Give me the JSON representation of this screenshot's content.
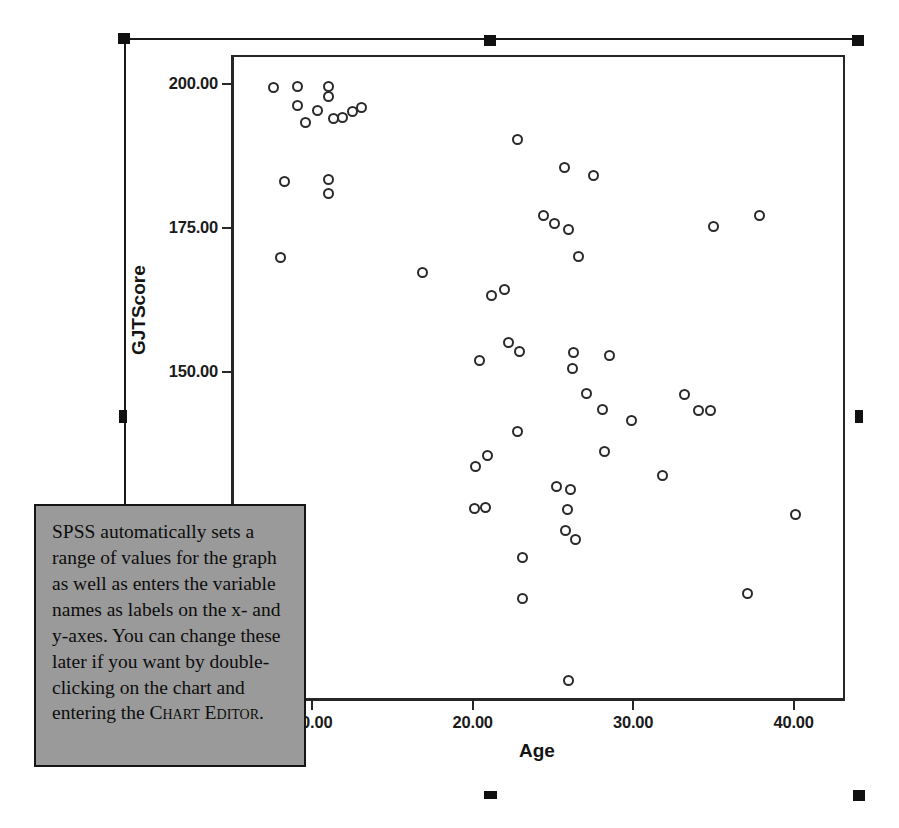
{
  "chart_data": {
    "type": "scatter",
    "title": "",
    "xlabel": "Age",
    "ylabel": "GJTScore",
    "xlim": [
      5.0,
      43.2
    ],
    "ylim": [
      93.0,
      205.0
    ],
    "xticks": [
      "10.00",
      "20.00",
      "30.00",
      "40.00"
    ],
    "xtick_values": [
      10,
      20,
      30,
      40
    ],
    "yticks": [
      "125.00",
      "150.00",
      "175.00",
      "200.00"
    ],
    "ytick_values": [
      125,
      150,
      175,
      200
    ],
    "grid": false,
    "legend": "none",
    "marker": "open-circle",
    "points": [
      {
        "x": 7.6,
        "y": 199.3
      },
      {
        "x": 9.1,
        "y": 199.6
      },
      {
        "x": 9.1,
        "y": 196.3
      },
      {
        "x": 9.6,
        "y": 193.2
      },
      {
        "x": 10.3,
        "y": 195.3
      },
      {
        "x": 8.3,
        "y": 183.0
      },
      {
        "x": 8.0,
        "y": 169.8
      },
      {
        "x": 11.0,
        "y": 199.6
      },
      {
        "x": 11.0,
        "y": 197.8
      },
      {
        "x": 11.3,
        "y": 194.0
      },
      {
        "x": 11.9,
        "y": 194.1
      },
      {
        "x": 12.5,
        "y": 195.2
      },
      {
        "x": 13.1,
        "y": 195.9
      },
      {
        "x": 11.0,
        "y": 183.4
      },
      {
        "x": 11.0,
        "y": 180.9
      },
      {
        "x": 16.9,
        "y": 167.2
      },
      {
        "x": 22.8,
        "y": 190.3
      },
      {
        "x": 25.7,
        "y": 185.5
      },
      {
        "x": 27.5,
        "y": 184.1
      },
      {
        "x": 24.4,
        "y": 177.2
      },
      {
        "x": 25.1,
        "y": 175.8
      },
      {
        "x": 26.0,
        "y": 174.7
      },
      {
        "x": 26.6,
        "y": 170.0
      },
      {
        "x": 35.0,
        "y": 175.2
      },
      {
        "x": 37.9,
        "y": 177.1
      },
      {
        "x": 21.2,
        "y": 163.2
      },
      {
        "x": 22.0,
        "y": 164.3
      },
      {
        "x": 20.4,
        "y": 152.0
      },
      {
        "x": 22.2,
        "y": 155.0
      },
      {
        "x": 22.9,
        "y": 153.6
      },
      {
        "x": 26.3,
        "y": 153.4
      },
      {
        "x": 28.5,
        "y": 152.9
      },
      {
        "x": 26.2,
        "y": 150.5
      },
      {
        "x": 27.1,
        "y": 146.3
      },
      {
        "x": 28.1,
        "y": 143.5
      },
      {
        "x": 29.9,
        "y": 141.5
      },
      {
        "x": 33.2,
        "y": 146.0
      },
      {
        "x": 34.1,
        "y": 143.2
      },
      {
        "x": 34.8,
        "y": 143.2
      },
      {
        "x": 22.8,
        "y": 139.6
      },
      {
        "x": 28.2,
        "y": 136.1
      },
      {
        "x": 20.2,
        "y": 133.5
      },
      {
        "x": 20.9,
        "y": 135.4
      },
      {
        "x": 20.1,
        "y": 126.2
      },
      {
        "x": 20.8,
        "y": 126.5
      },
      {
        "x": 31.8,
        "y": 132.0
      },
      {
        "x": 25.2,
        "y": 130.0
      },
      {
        "x": 26.1,
        "y": 129.6
      },
      {
        "x": 25.9,
        "y": 126.0
      },
      {
        "x": 25.8,
        "y": 122.5
      },
      {
        "x": 26.4,
        "y": 120.9
      },
      {
        "x": 23.1,
        "y": 117.8
      },
      {
        "x": 40.1,
        "y": 125.2
      },
      {
        "x": 23.1,
        "y": 110.6
      },
      {
        "x": 37.1,
        "y": 111.5
      },
      {
        "x": 26.0,
        "y": 96.4
      }
    ]
  },
  "callout": {
    "text_parts": [
      "SPSS automatically sets a range of values for the graph as well as enters the variable names as labels on the x- and y-axes. You can change these later if you want by double-clicking on the chart and entering the ",
      "Chart Editor",
      "."
    ],
    "background_color": "#9a9a9a",
    "border_color": "#151515"
  },
  "selection": {
    "handle_color": "#111111",
    "handles": [
      {
        "name": "handle-top-left",
        "x": 118,
        "y": 33
      },
      {
        "name": "handle-top-center",
        "x": 484,
        "y": 35
      },
      {
        "name": "handle-top-right",
        "x": 852,
        "y": 35
      },
      {
        "name": "handle-middle-left",
        "x": 119,
        "y": 410
      },
      {
        "name": "handle-middle-right",
        "x": 855,
        "y": 410
      },
      {
        "name": "handle-bottom-center",
        "x": 484,
        "y": 791
      },
      {
        "name": "handle-bottom-right",
        "x": 853,
        "y": 790
      }
    ]
  },
  "colors": {
    "axis": "#262626",
    "marker_stroke": "#2a2a2a",
    "text": "#141414"
  }
}
